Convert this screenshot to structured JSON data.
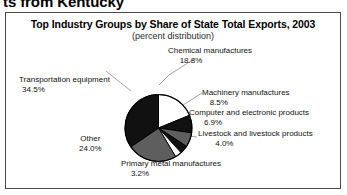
{
  "page": {
    "heading_clipped": "ts from Kentucky"
  },
  "figure": {
    "title": "Top Industry Groups by Share of State Total Exports, 2003",
    "subtitle": "(percent distribution)"
  },
  "chart_data": {
    "type": "pie",
    "title": "Top Industry Groups by Share of State Total Exports, 2003",
    "subtitle": "(percent distribution)",
    "units": "percent distribution",
    "legend": "callout-labels",
    "grid": false,
    "start_angle_deg": 0,
    "direction": "clockwise",
    "categories": [
      "Chemical manufactures",
      "Machinery manufactures",
      "Computer and electronic products",
      "Livestock and livestock products",
      "Primary metal manufactures",
      "Other",
      "Transportation equipment"
    ],
    "values": [
      18.8,
      8.5,
      6.9,
      4.0,
      3.2,
      24.0,
      34.5
    ],
    "slices": [
      {
        "label": "Chemical manufactures",
        "value": 18.8,
        "value_text": "18.8%",
        "color": "#ffffff"
      },
      {
        "label": "Machinery manufactures",
        "value": 8.5,
        "value_text": "8.5%",
        "color": "#111111"
      },
      {
        "label": "Computer and electronic products",
        "value": 6.9,
        "value_text": "6.9%",
        "color": "#5e5e5e"
      },
      {
        "label": "Livestock and livestock products",
        "value": 4.0,
        "value_text": "4.0%",
        "color": "#111111"
      },
      {
        "label": "Primary metal manufactures",
        "value": 3.2,
        "value_text": "3.2%",
        "color": "#ffffff"
      },
      {
        "label": "Other",
        "value": 24.0,
        "value_text": "24.0%",
        "color": "#5e5e5e"
      },
      {
        "label": "Transportation equipment",
        "value": 34.5,
        "value_text": "34.5%",
        "color": "#111111"
      }
    ]
  },
  "colors": {
    "frame_border": "#4a4a4a",
    "pie_outline": "#000000",
    "leader_line": "#8c8c8c",
    "dark_slice": "#111111",
    "gray_slice": "#5e5e5e",
    "light_slice": "#ffffff",
    "text": "#111111"
  }
}
